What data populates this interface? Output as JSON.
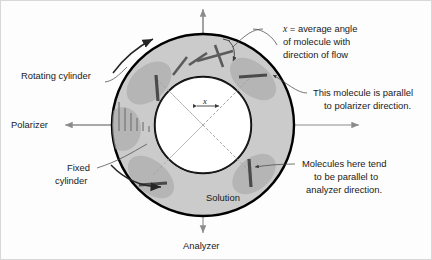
{
  "figure": {
    "background_color": "#fdfdfd",
    "border_color": "#d8d8d8",
    "annulus_fill": "#cbcbcb",
    "inner_fill": "#ffffff",
    "ring_stroke": "#000000",
    "molecule_color": "#5b5b5b",
    "axis_color": "#8b8b8b",
    "leader_color": "#4a4a4a"
  },
  "labels": {
    "rotating_cylinder": "Rotating cylinder",
    "polarizer": "Polarizer",
    "fixed_cylinder_line1": "Fixed",
    "fixed_cylinder_line2": "cylinder",
    "solution": "Solution",
    "analyzer": "Analyzer",
    "angle_symbol": "x"
  },
  "callouts": [
    {
      "name": "average-angle-callout",
      "lines": [
        "x = average angle",
        "of molecule with",
        "direction of flow"
      ],
      "italic_lead": "x",
      "rest_first_line": " = average angle"
    },
    {
      "name": "polarizer-parallel-callout",
      "lines": [
        "This molecule is parallel",
        "to polarizer direction."
      ]
    },
    {
      "name": "analyzer-parallel-callout",
      "lines": [
        "Molecules here tend",
        "to be parallel to",
        "analyzer direction."
      ]
    }
  ],
  "geometry": {
    "center_x": 202,
    "center_y": 124,
    "outer_radius": 91,
    "inner_radius": 48,
    "diagonal_angles_deg": [
      45,
      135
    ],
    "vertical_axis": "analyzer direction",
    "horizontal_axis": "polarizer direction"
  },
  "molecules": [
    {
      "name": "molecule-nw-vertical",
      "orientation": "vertical",
      "quadrant": "north-west"
    },
    {
      "name": "molecule-ne-horizontal",
      "orientation": "horizontal",
      "quadrant": "north-east"
    },
    {
      "name": "molecule-sw-horizontal",
      "orientation": "horizontal",
      "quadrant": "south-west"
    },
    {
      "name": "molecule-se-vertical",
      "orientation": "vertical",
      "quadrant": "south-east"
    },
    {
      "name": "molecule-top-tilted-a",
      "orientation": "tilted",
      "quadrant": "north"
    },
    {
      "name": "molecule-top-tilted-b",
      "orientation": "tilted",
      "quadrant": "north"
    },
    {
      "name": "molecule-top-crossed",
      "orientation": "crossed-pair",
      "quadrant": "north"
    }
  ]
}
